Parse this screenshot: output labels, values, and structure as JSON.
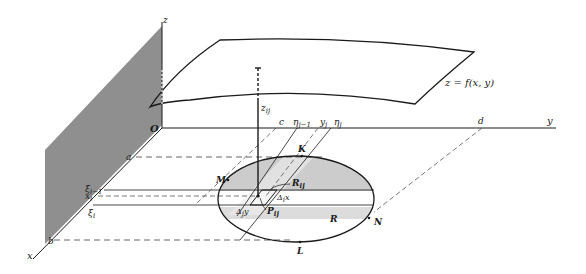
{
  "figure": {
    "type": "double-integral-riemann-sum-diagram",
    "surface_label": "z = f(x, y)",
    "axes": {
      "x": "x",
      "y": "y",
      "z": "z",
      "origin": "O"
    },
    "x_interval": {
      "start": "a",
      "end": "b",
      "partition": [
        "ξ_{i−1}",
        "x_i",
        "ξ_i"
      ]
    },
    "y_interval": {
      "start": "c",
      "end": "d",
      "partition": [
        "η_{j−1}",
        "y_j",
        "η_j"
      ]
    },
    "region_label": "R",
    "boundary_points": [
      "K",
      "M",
      "N",
      "L"
    ],
    "cell_label": "R_ij",
    "sample_point": "P_ij",
    "height_label": "z_ij",
    "delta_x": "Δ_i x",
    "delta_y": "Δ_j y",
    "colors": {
      "wall": "#8a8a8a",
      "shaded": "#c8c8c8",
      "ink": "#1a1a1a",
      "dash": "#555555"
    }
  },
  "labels": {
    "z_axis": "z",
    "y_axis": "y",
    "x_axis": "x",
    "origin": "O",
    "surface": "z = f(x, y)",
    "a": "a",
    "b": "b",
    "c": "c",
    "d": "d",
    "xi_prev": "ξ",
    "xi_prev_sub": "i−1",
    "x_i": "x",
    "x_i_sub": "i",
    "xi": "ξ",
    "xi_sub": "i",
    "eta_prev": "η",
    "eta_prev_sub": "j−1",
    "y_j": "y",
    "y_j_sub": "j",
    "eta": "η",
    "eta_sub": "j",
    "z_ij": "z",
    "z_ij_sub": "ij",
    "K": "K",
    "M": "M",
    "N": "N",
    "L": "L",
    "R": "R",
    "R_ij": "R",
    "R_ij_sub": "ij",
    "P_ij": "P",
    "P_ij_sub": "ij",
    "dx": "Δ",
    "dx_sub": "i",
    "dx_tail": "x",
    "dy": "Δ",
    "dy_sub": "j",
    "dy_tail": "y"
  }
}
